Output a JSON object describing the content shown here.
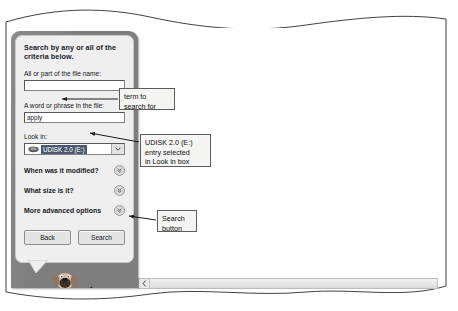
{
  "search_panel": {
    "heading": "Search by any or all of the criteria below.",
    "fields": [
      {
        "label": "All or part of the file name:",
        "value": "",
        "name": "file-name"
      },
      {
        "label": "A word or phrase in the file:",
        "value": "apply",
        "name": "word-phrase"
      }
    ],
    "look_in": {
      "label": "Look in:",
      "selected_value": "UDISK 2.0 (E:)",
      "icon": "removable-disk-icon",
      "dropdown_icon": "chevron-down-icon",
      "selection_color": "#4a5a72"
    },
    "collapsible_sections": [
      {
        "label": "When was it modified?",
        "icon": "chevron-double-down-icon"
      },
      {
        "label": "What size is it?",
        "icon": "chevron-double-down-icon"
      },
      {
        "label": "More advanced options",
        "icon": "chevron-double-down-icon"
      }
    ],
    "buttons": [
      {
        "label": "Back",
        "name": "back-button"
      },
      {
        "label": "Search",
        "name": "search-button"
      }
    ],
    "assistant": "search-companion-dog",
    "panel_color": "#7e7e7e",
    "card_color": "#efefef"
  },
  "annotations": [
    {
      "id": "term",
      "text": "term to\nsearch for"
    },
    {
      "id": "udisk",
      "text": "UDISK 2.0 (E:)\nentry selected\nin Look in box"
    },
    {
      "id": "search",
      "text": "Search\nbutton"
    }
  ],
  "document_pane": {
    "scrollbar": {
      "left_arrow_icon": "chevron-left-icon"
    }
  },
  "cursor": "mouse-pointer-icon"
}
